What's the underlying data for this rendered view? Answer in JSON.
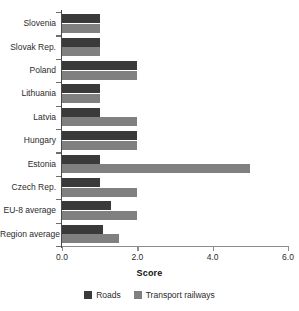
{
  "chart_data": {
    "type": "bar",
    "orientation": "horizontal",
    "title": "",
    "xlabel": "Score",
    "ylabel": "",
    "xlim": [
      0.0,
      6.0
    ],
    "xticks": [
      "0.0",
      "2.0",
      "4.0",
      "6.0"
    ],
    "xtick_values": [
      0.0,
      2.0,
      4.0,
      6.0
    ],
    "grid": false,
    "legend_position": "bottom",
    "categories": [
      "Slovenia",
      "Slovak Rep.",
      "Poland",
      "Lithuania",
      "Latvia",
      "Hungary",
      "Estonia",
      "Czech Rep.",
      "EU-8 average",
      "Region average"
    ],
    "series": [
      {
        "name": "Roads",
        "color": "#3a3a3a",
        "values": [
          1.0,
          1.0,
          2.0,
          1.0,
          1.0,
          2.0,
          1.0,
          1.0,
          1.3,
          1.1
        ]
      },
      {
        "name": "Transport railways",
        "color": "#808080",
        "values": [
          1.0,
          1.0,
          2.0,
          1.0,
          2.0,
          2.0,
          5.0,
          2.0,
          2.0,
          1.5
        ]
      }
    ]
  },
  "legend": {
    "items": [
      {
        "label": "Roads",
        "color": "#3a3a3a"
      },
      {
        "label": "Transport railways",
        "color": "#808080"
      }
    ]
  }
}
